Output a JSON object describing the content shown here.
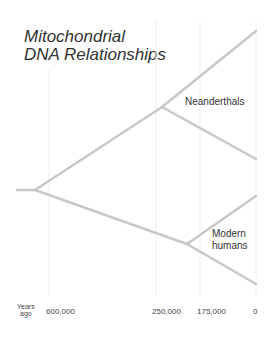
{
  "title": {
    "line1": "Mitochondrial",
    "line2": "DNA Relationships"
  },
  "labels": {
    "neanderthals": "Neanderthals",
    "modern_humans_line1": "Modern",
    "modern_humans_line2": "humans"
  },
  "axis": {
    "unit_line1": "Years",
    "unit_line2": "ago",
    "ticks": [
      "600,000",
      "250,000",
      "175,000",
      "0"
    ]
  },
  "colors": {
    "branch": "#c8c8c8",
    "gridline": "#eeeeee",
    "text": "#333333"
  }
}
